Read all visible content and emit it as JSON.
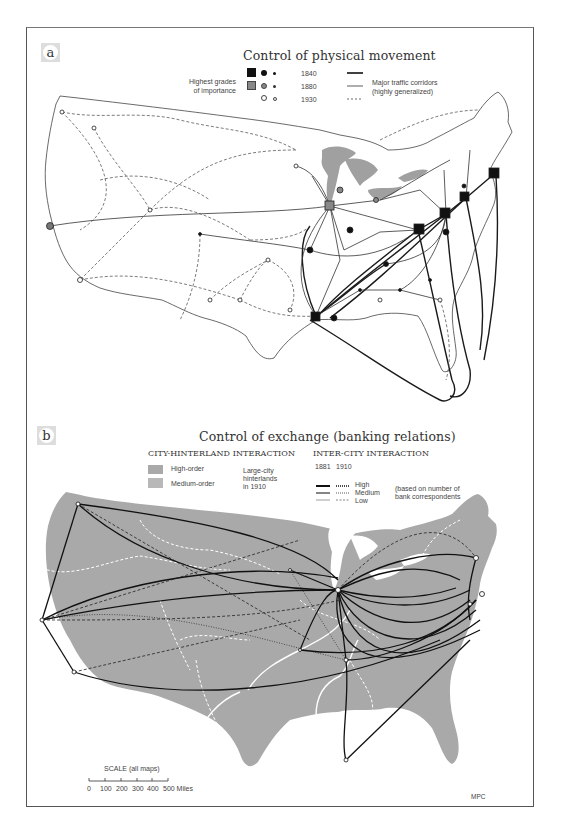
{
  "panel_a": {
    "badge": "a",
    "title": "Control of physical movement",
    "legend": {
      "grades_label_line1": "Highest grades",
      "grades_label_line2": "of importance",
      "years": [
        "1840",
        "1880",
        "1930"
      ],
      "corridor_label_line1": "Major traffic corridors",
      "corridor_label_line2": "(highly generalized)"
    }
  },
  "panel_b": {
    "badge": "b",
    "title": "Control of exchange (banking relations)",
    "city_hinterland": {
      "heading": "CITY-HINTERLAND INTERACTION",
      "items": [
        {
          "label": "High-order"
        },
        {
          "label": "Medium-order"
        }
      ],
      "note_line1": "Large-city",
      "note_line2": "hinterlands",
      "note_line3": "in 1910"
    },
    "inter_city": {
      "heading": "INTER-CITY INTERACTION",
      "years": [
        "1881",
        "1910"
      ],
      "levels": [
        "High",
        "Medium",
        "Low"
      ],
      "note_line1": "(based on number of",
      "note_line2": "bank correspondents"
    }
  },
  "scale": {
    "title": "SCALE (all maps)",
    "ticks": [
      "0",
      "100",
      "200",
      "300",
      "400",
      "500 Miles"
    ]
  },
  "credit": "MPC",
  "colors": {
    "land_gray": "#a9a9a9",
    "ink": "#1a1a1a",
    "lake_gray": "#a0a0a0",
    "hinterland_white": "#ffffff"
  }
}
